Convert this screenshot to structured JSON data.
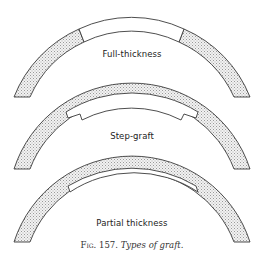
{
  "figure": {
    "number": "Fig. 157.",
    "title": "Types of graft.",
    "panels": [
      {
        "id": "full-thickness",
        "label": "Full-thickness"
      },
      {
        "id": "step-graft",
        "label": "Step-graft"
      },
      {
        "id": "partial-thickness",
        "label": "Partial thickness"
      }
    ]
  },
  "colors": {
    "stroke": "#3a3a3a",
    "stipple": "#9a9a9a",
    "background": "#ffffff"
  }
}
